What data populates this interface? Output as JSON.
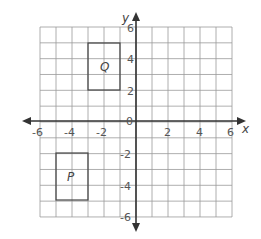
{
  "diagram": {
    "type": "coordinate-plane",
    "x_axis": {
      "label": "x",
      "min": -6,
      "max": 6,
      "tick_labels": [
        "-6",
        "-4",
        "-2",
        "2",
        "4",
        "6"
      ]
    },
    "y_axis": {
      "label": "y",
      "min": -6,
      "max": 6,
      "tick_labels": [
        "6",
        "4",
        "2",
        "-2",
        "-4",
        "-6"
      ]
    },
    "origin_label": "0",
    "shapes": [
      {
        "name": "Q",
        "label": "Q",
        "x1": -3,
        "y1": 2,
        "x2": -1,
        "y2": 5
      },
      {
        "name": "P",
        "label": "P",
        "x1": -5,
        "y1": -5,
        "x2": -3,
        "y2": -2
      }
    ],
    "colors": {
      "grid": "#9a9a9a",
      "axis": "#333333",
      "shape": "#444444"
    }
  }
}
